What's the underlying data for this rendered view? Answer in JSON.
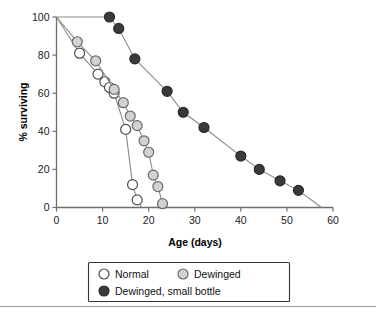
{
  "chart_data": {
    "type": "line",
    "title": "",
    "xlabel": "Age (days)",
    "ylabel": "% surviving",
    "xlim": [
      0,
      60
    ],
    "ylim": [
      0,
      100
    ],
    "xticks": [
      0,
      10,
      20,
      30,
      40,
      50,
      60
    ],
    "yticks": [
      0,
      20,
      40,
      60,
      80,
      100
    ],
    "grid": false,
    "legend_position": "bottom",
    "series": [
      {
        "name": "Normal",
        "marker": "open-circle",
        "marker_fill": "#ffffff",
        "marker_edge": "#4d4d4d",
        "line_color": "#8a8a8a",
        "points": [
          {
            "x": 0,
            "y": 100
          },
          {
            "x": 5,
            "y": 81
          },
          {
            "x": 9,
            "y": 70
          },
          {
            "x": 10.5,
            "y": 66
          },
          {
            "x": 11.5,
            "y": 63
          },
          {
            "x": 12.5,
            "y": 60
          },
          {
            "x": 15,
            "y": 41
          },
          {
            "x": 16.5,
            "y": 12
          },
          {
            "x": 17.5,
            "y": 4
          },
          {
            "x": 18.5,
            "y": 0
          }
        ]
      },
      {
        "name": "Dewinged",
        "marker": "filled-circle",
        "marker_fill": "#d2d2d2",
        "marker_edge": "#6b6b6b",
        "line_color": "#8a8a8a",
        "points": [
          {
            "x": 0,
            "y": 100
          },
          {
            "x": 4.5,
            "y": 87
          },
          {
            "x": 8.5,
            "y": 77
          },
          {
            "x": 12.5,
            "y": 62
          },
          {
            "x": 14.5,
            "y": 55
          },
          {
            "x": 16,
            "y": 48
          },
          {
            "x": 17.5,
            "y": 43
          },
          {
            "x": 19,
            "y": 35
          },
          {
            "x": 20,
            "y": 29
          },
          {
            "x": 21,
            "y": 17
          },
          {
            "x": 22,
            "y": 11
          },
          {
            "x": 23,
            "y": 2
          },
          {
            "x": 24,
            "y": 0
          }
        ]
      },
      {
        "name": "Dewinged, small bottle",
        "marker": "filled-circle",
        "marker_fill": "#3a3a3a",
        "marker_edge": "#2a2a2a",
        "line_color": "#8a8a8a",
        "points": [
          {
            "x": 0,
            "y": 100
          },
          {
            "x": 11.5,
            "y": 100
          },
          {
            "x": 13.5,
            "y": 94
          },
          {
            "x": 17,
            "y": 78
          },
          {
            "x": 24,
            "y": 61
          },
          {
            "x": 27.5,
            "y": 50
          },
          {
            "x": 32,
            "y": 42
          },
          {
            "x": 40,
            "y": 27
          },
          {
            "x": 44,
            "y": 20
          },
          {
            "x": 48.5,
            "y": 14
          },
          {
            "x": 52.5,
            "y": 9
          },
          {
            "x": 57.5,
            "y": 0
          }
        ]
      }
    ]
  },
  "axis": {
    "x_title": "Age (days)",
    "y_title": "% surviving",
    "x_tick_labels": [
      "0",
      "10",
      "20",
      "30",
      "40",
      "50",
      "60"
    ],
    "y_tick_labels": [
      "0",
      "20",
      "40",
      "60",
      "80",
      "100"
    ]
  },
  "legend": {
    "entries": [
      {
        "label": "Normal",
        "marker": "open-circle"
      },
      {
        "label": "Dewinged",
        "marker": "light-filled-circle"
      },
      {
        "label": "Dewinged, small bottle",
        "marker": "dark-filled-circle"
      }
    ]
  }
}
